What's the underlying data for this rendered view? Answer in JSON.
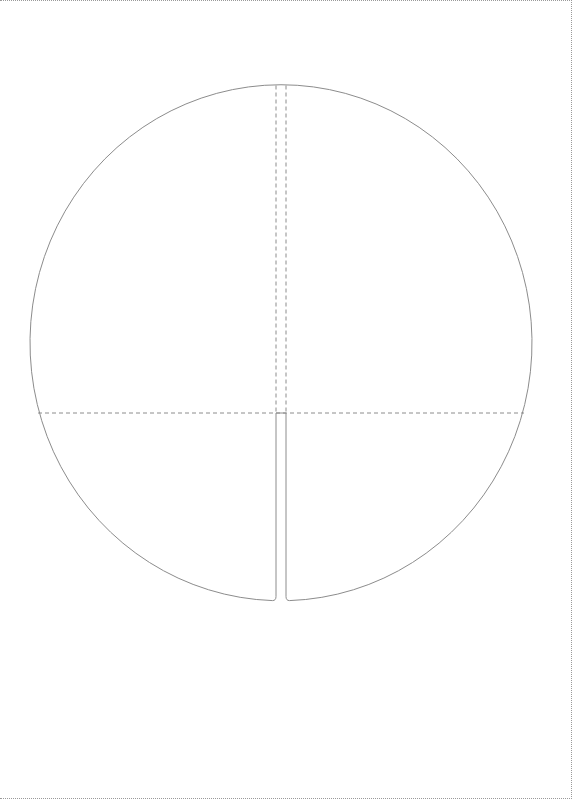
{
  "diagram": {
    "type": "die-cut template",
    "canvas": {
      "width": 572,
      "height": 799
    },
    "colors": {
      "background": "#ffffff",
      "cut_line": "#8c8c8c",
      "fold_line": "#8c8c8c",
      "page_border": "#9a9a9a"
    },
    "shape": {
      "center_x": 281,
      "center_y": 342,
      "radius_x": 251,
      "radius_y": 258,
      "slot_left_x": 276,
      "slot_right_x": 286,
      "slot_top_y": 412
    },
    "fold_lines": {
      "vertical_left_x": 276,
      "vertical_right_x": 286,
      "horizontal_y": 412
    }
  }
}
